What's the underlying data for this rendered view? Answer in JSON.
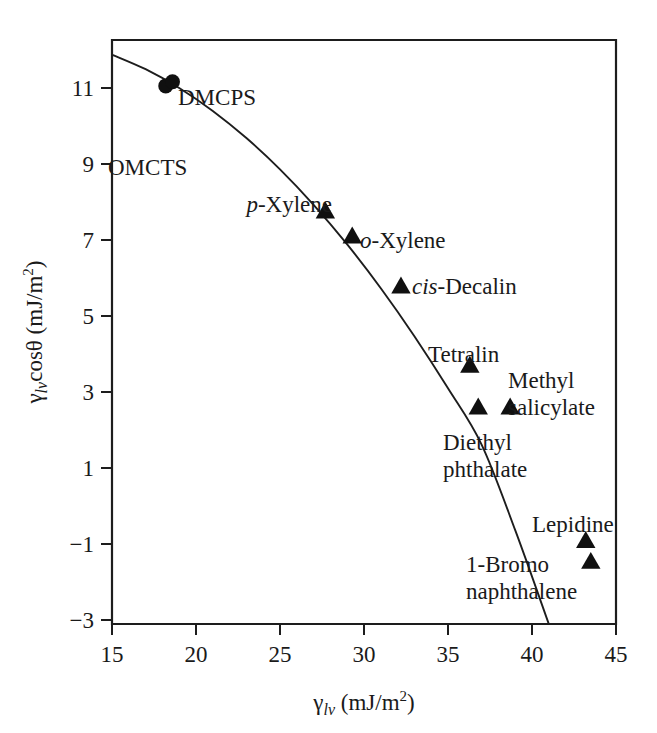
{
  "chart_data": {
    "type": "scatter",
    "title": "",
    "xlabel": "γlv (mJ/m2)",
    "ylabel": "γlv cosθ (mJ/m2)",
    "xlim": [
      15,
      45
    ],
    "ylim": [
      -3,
      11
    ],
    "grid": false,
    "legend": "none",
    "xticks": [
      "15",
      "20",
      "25",
      "30",
      "35",
      "40",
      "45"
    ],
    "xtick_values": [
      15,
      20,
      25,
      30,
      35,
      40,
      45
    ],
    "yticks": [
      "11",
      "9",
      "7",
      "5",
      "3",
      "1",
      "−1",
      "−3"
    ],
    "ytick_values": [
      11,
      9,
      7,
      5,
      3,
      1,
      -1,
      -3
    ],
    "points": [
      {
        "label": "OMCTS",
        "label_prefix": "",
        "x": 18.2,
        "y": 9.9,
        "marker": "circle"
      },
      {
        "label": "DMCPS",
        "label_prefix": "",
        "x": 18.6,
        "y": 10.0,
        "marker": "circle"
      },
      {
        "label": "Xylene",
        "label_prefix": "p",
        "x": 27.7,
        "y": 6.9,
        "marker": "triangle"
      },
      {
        "label": "Xylene",
        "label_prefix": "o",
        "x": 29.3,
        "y": 6.3,
        "marker": "triangle"
      },
      {
        "label": "Decalin",
        "label_prefix": "cis",
        "x": 32.2,
        "y": 5.1,
        "marker": "triangle"
      },
      {
        "label": "Tetralin",
        "label_prefix": "",
        "x": 36.3,
        "y": 3.2,
        "marker": "triangle"
      },
      {
        "label": "Diethyl phthalate",
        "label_prefix": "",
        "x": 36.8,
        "y": 2.2,
        "marker": "triangle"
      },
      {
        "label": "Methyl salicylate",
        "label_prefix": "",
        "x": 38.7,
        "y": 2.2,
        "marker": "triangle"
      },
      {
        "label": "Lepidine",
        "label_prefix": "",
        "x": 43.2,
        "y": -1.0,
        "marker": "triangle"
      },
      {
        "label": "1-Bromo naphthalene",
        "label_prefix": "",
        "x": 43.5,
        "y": -1.5,
        "marker": "triangle"
      }
    ],
    "curve": {
      "name": "fitted-curve",
      "x": [
        15.0,
        17.0,
        19.0,
        21.0,
        23.0,
        25.0,
        27.0,
        29.0,
        31.0,
        33.0,
        35.0,
        37.0,
        39.0,
        41.0
      ],
      "y": [
        10.65,
        10.3,
        9.85,
        9.3,
        8.65,
        7.9,
        7.05,
        6.1,
        5.05,
        3.9,
        2.65,
        1.3,
        -0.75,
        -3.0
      ]
    }
  },
  "axis_labels": {
    "y_gamma": "γ",
    "y_sub": "lv",
    "y_cos": "cosθ",
    "y_units_open": " (mJ/m",
    "y_units_sup": "2",
    "y_units_close": ")",
    "x_gamma": "γ",
    "x_sub": "lv",
    "x_units_open": " (mJ/m",
    "x_units_sup": "2",
    "x_units_close": ")"
  },
  "point_labels": {
    "omcts": "OMCTS",
    "dmcps": "DMCPS",
    "p_prefix": "p",
    "p_xylene": "-Xylene",
    "o_prefix": "o",
    "o_xylene": "-Xylene",
    "cis_prefix": "cis",
    "cis_decalin": "-Decalin",
    "tetralin": "Tetralin",
    "methyl": "Methyl",
    "salicylate": "salicylate",
    "diethyl": "Diethyl",
    "phthalate": "phthalate",
    "lepidine": "Lepidine",
    "bromo": "1-Bromo",
    "naphthalene": "naphthalene"
  },
  "tick_labels": {
    "x": [
      "15",
      "20",
      "25",
      "30",
      "35",
      "40",
      "45"
    ],
    "y": [
      "11",
      "9",
      "7",
      "5",
      "3",
      "1",
      "−1",
      "−3"
    ]
  },
  "colors": {
    "axis": "#1d1d1d",
    "marker": "#101010",
    "curve": "#1d1d1d",
    "background": "#ffffff"
  }
}
